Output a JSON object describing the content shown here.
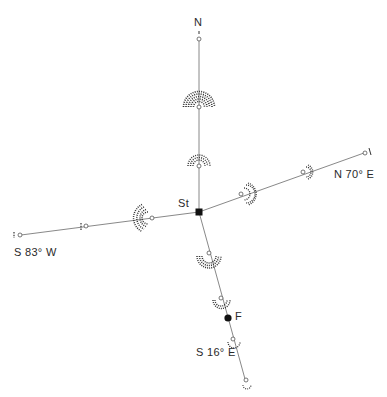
{
  "diagram": {
    "station_label": "St",
    "point_f_label": "F",
    "directions": {
      "north": "N",
      "east": "N 70° E",
      "west": "S 83° W",
      "south": "S 16° E"
    },
    "colors": {
      "line": "#7a7a7a",
      "mark": "#111111",
      "arc": "#333333"
    }
  }
}
